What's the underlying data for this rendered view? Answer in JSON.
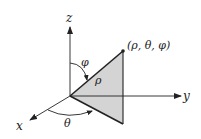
{
  "diagram": {
    "colors": {
      "stroke": "#222222",
      "triangle_fill": "#d4d4d4",
      "background": "#ffffff"
    },
    "axes": {
      "x": {
        "label": "x"
      },
      "y": {
        "label": "y"
      },
      "z": {
        "label": "z"
      }
    },
    "point": {
      "label": "(ρ, θ, φ)"
    },
    "radius": {
      "label": "ρ"
    },
    "angles": {
      "polar": {
        "label": "φ"
      },
      "azimuthal": {
        "label": "θ"
      }
    }
  }
}
